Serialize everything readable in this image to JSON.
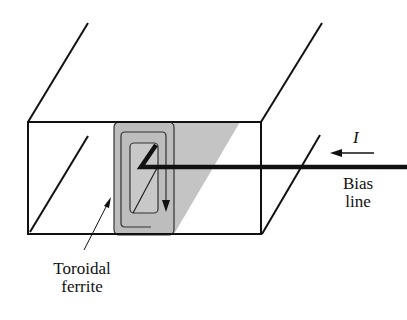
{
  "figure": {
    "labels": {
      "current": "I",
      "bias_line_1": "Bias",
      "bias_line_2": "line",
      "ferrite_1": "Toroidal",
      "ferrite_2": "ferrite"
    },
    "colors": {
      "line": "#111111",
      "ferrite_fill": "#bdbdbd",
      "shade_fill": "#c4c4c4",
      "background": "#ffffff"
    }
  }
}
